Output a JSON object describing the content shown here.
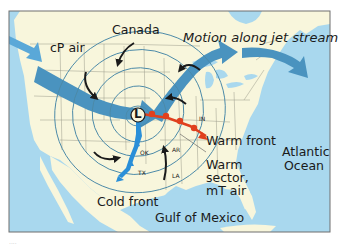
{
  "diagram": {
    "colors": {
      "ocean": "#a9d8ee",
      "land": "#f8f6dc",
      "frame": "#6f6f6f",
      "jet_stream_arrow": "#4a93bf",
      "jet_stream_arrow_light": "#5aa8d8",
      "isobar": "#4b8aa8",
      "circulation_arrow": "#1a1a1a",
      "cold_front": "#2a8fd8",
      "warm_front": "#e0401e",
      "state_border": "#9a9a8a",
      "low_letter": "#111111"
    },
    "labels": {
      "canada": "Canada",
      "cp_air": "cP air",
      "motion": "Motion along jet stream",
      "low": "L",
      "warm_front": "Warm front",
      "warm_sector_1": "Warm",
      "warm_sector_2": "sector,",
      "warm_sector_3": "mT air",
      "atlantic_1": "Atlantic",
      "atlantic_2": "Ocean",
      "cold_front": "Cold front",
      "gulf": "Gulf of Mexico",
      "states": {
        "in": "IN",
        "ok": "OK",
        "ar": "AR",
        "tx": "TX",
        "la": "LA"
      }
    },
    "caption": "...."
  }
}
